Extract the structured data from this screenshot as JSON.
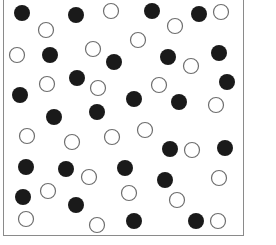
{
  "diagram": {
    "type": "dot-field",
    "frame": {
      "x": 3,
      "y": -2,
      "width": 241,
      "height": 238,
      "border_color": "#8a8a8a"
    },
    "dot_radius": 8,
    "colors": {
      "filled": "#1a1a1a",
      "open_stroke": "#6e6e6e",
      "open_fill": "#ffffff"
    },
    "filled_count": 25,
    "open_count": 25,
    "filled": [
      [
        22,
        13
      ],
      [
        76,
        15
      ],
      [
        152,
        11
      ],
      [
        199,
        14
      ],
      [
        50,
        55
      ],
      [
        114,
        62
      ],
      [
        168,
        57
      ],
      [
        219,
        53
      ],
      [
        20,
        95
      ],
      [
        77,
        78
      ],
      [
        227,
        82
      ],
      [
        134,
        99
      ],
      [
        179,
        102
      ],
      [
        54,
        117
      ],
      [
        97,
        112
      ],
      [
        26,
        167
      ],
      [
        66,
        169
      ],
      [
        125,
        168
      ],
      [
        170,
        149
      ],
      [
        225,
        148
      ],
      [
        165,
        180
      ],
      [
        23,
        197
      ],
      [
        76,
        205
      ],
      [
        134,
        221
      ],
      [
        196,
        221
      ]
    ],
    "open": [
      [
        111,
        11
      ],
      [
        46,
        30
      ],
      [
        175,
        26
      ],
      [
        221,
        12
      ],
      [
        138,
        40
      ],
      [
        93,
        49
      ],
      [
        17,
        55
      ],
      [
        47,
        84
      ],
      [
        98,
        88
      ],
      [
        191,
        66
      ],
      [
        159,
        85
      ],
      [
        216,
        105
      ],
      [
        27,
        136
      ],
      [
        72,
        142
      ],
      [
        112,
        137
      ],
      [
        145,
        130
      ],
      [
        192,
        150
      ],
      [
        89,
        177
      ],
      [
        219,
        178
      ],
      [
        48,
        191
      ],
      [
        129,
        193
      ],
      [
        177,
        200
      ],
      [
        26,
        219
      ],
      [
        97,
        225
      ],
      [
        218,
        221
      ]
    ]
  }
}
